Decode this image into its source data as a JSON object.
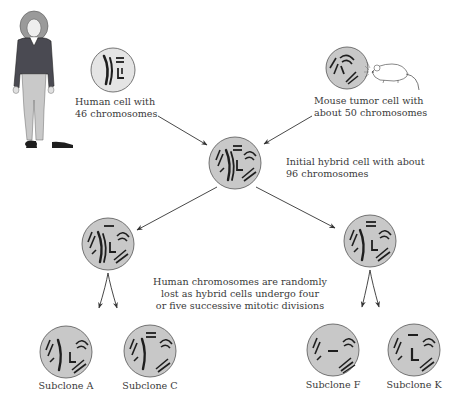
{
  "diagram": {
    "colors": {
      "cell_fill": "#c8c8c8",
      "cell_stroke": "#555555",
      "chromosome": "#1e1e1e",
      "arrow": "#333333",
      "text": "#3a3a3a",
      "jacket": "#4a4a52",
      "pants": "#c9c9c9",
      "hair": "#9a9a9a"
    },
    "sources": {
      "human": {
        "label_line1": "Human cell with",
        "label_line2": "46 chromosomes"
      },
      "mouse": {
        "label_line1": "Mouse tumor cell with",
        "label_line2": "about 50 chromosomes"
      }
    },
    "hybrid": {
      "label_line1": "Initial hybrid cell with about",
      "label_line2": "96 chromosomes"
    },
    "note": {
      "line1": "Human chromosomes are randomly",
      "line2": "lost as hybrid cells undergo four",
      "line3": "or five successive mitotic divisions"
    },
    "subclones": [
      {
        "label": "Subclone A"
      },
      {
        "label": "Subclone C"
      },
      {
        "label": "Subclone F"
      },
      {
        "label": "Subclone K"
      }
    ]
  }
}
